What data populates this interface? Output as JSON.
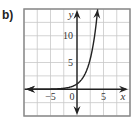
{
  "panel_label": "b)",
  "chart_data": {
    "type": "line",
    "title": "",
    "xlabel": "x",
    "ylabel": "y",
    "xlim": [
      -10,
      10
    ],
    "ylim": [
      -5,
      15
    ],
    "grid": true,
    "grid_step": 2.5,
    "x_ticks": [
      {
        "value": -5,
        "label": "−5"
      },
      {
        "value": 0,
        "label": "0"
      },
      {
        "value": 5,
        "label": "5"
      }
    ],
    "y_ticks": [
      {
        "value": 5,
        "label": "5"
      },
      {
        "value": 10,
        "label": "10"
      }
    ],
    "series": [
      {
        "name": "exponential curve",
        "function": "y = 2^x",
        "x": [
          -10,
          -8,
          -6,
          -4,
          -3,
          -2,
          -1,
          0,
          1,
          2,
          3,
          3.5,
          3.9
        ],
        "y": [
          0.001,
          0.004,
          0.016,
          0.0625,
          0.125,
          0.25,
          0.5,
          1,
          2,
          4,
          8,
          11.3,
          14.9
        ],
        "arrows": "both-ends",
        "color": "#222222"
      }
    ],
    "axis_color": "#222222",
    "grid_color": "#c8c8c8",
    "frame_color": "#8a8a8a"
  }
}
